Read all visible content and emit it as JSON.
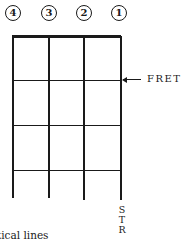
{
  "diagram": {
    "type": "ukulele chord chart grid (fretboard diagram)",
    "string_numbers": [
      "4",
      "3",
      "2",
      "1"
    ],
    "fret_label": "FRET",
    "fret_arrow": "←",
    "string_label_letters": [
      "S",
      "T",
      "R"
    ],
    "bottom_caption_fragment": "tical lines",
    "colors": {
      "ink": "#1a1a1a",
      "background": "#ffffff"
    },
    "grid": {
      "strings": 4,
      "frets_shown": 3,
      "nut": "thick top line"
    }
  }
}
